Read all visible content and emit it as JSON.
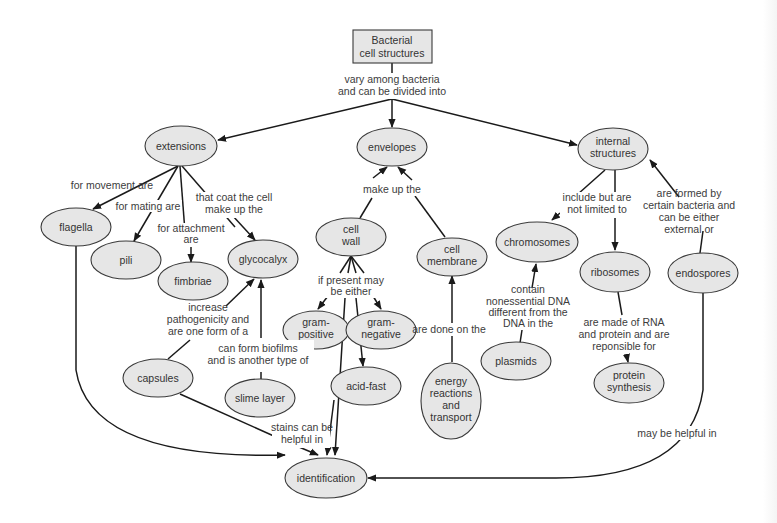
{
  "colors": {
    "node_fill": "#e6e6e6",
    "node_stroke": "#3a3a3a",
    "edge": "#1a1a1a",
    "text": "#333333",
    "background": "#ffffff"
  },
  "root": {
    "lines": [
      "Bacterial",
      "cell structures"
    ]
  },
  "nodes": {
    "extensions": {
      "lines": [
        "extensions"
      ]
    },
    "envelopes": {
      "lines": [
        "envelopes"
      ]
    },
    "internal_structures": {
      "lines": [
        "internal",
        "structures"
      ]
    },
    "flagella": {
      "lines": [
        "flagella"
      ]
    },
    "pili": {
      "lines": [
        "pili"
      ]
    },
    "fimbriae": {
      "lines": [
        "fimbriae"
      ]
    },
    "glycocalyx": {
      "lines": [
        "glycocalyx"
      ]
    },
    "cell_wall": {
      "lines": [
        "cell",
        "wall"
      ]
    },
    "cell_membrane": {
      "lines": [
        "cell",
        "membrane"
      ]
    },
    "chromosomes": {
      "lines": [
        "chromosomes"
      ]
    },
    "ribosomes": {
      "lines": [
        "ribosomes"
      ]
    },
    "endospores": {
      "lines": [
        "endospores"
      ]
    },
    "gram_positive": {
      "lines": [
        "gram-",
        "positive"
      ]
    },
    "gram_negative": {
      "lines": [
        "gram-",
        "negative"
      ]
    },
    "acid_fast": {
      "lines": [
        "acid-fast"
      ]
    },
    "capsules": {
      "lines": [
        "capsules"
      ]
    },
    "slime_layer": {
      "lines": [
        "slime layer"
      ]
    },
    "plasmids": {
      "lines": [
        "plasmids"
      ]
    },
    "energy_reactions": {
      "lines": [
        "energy",
        "reactions",
        "and",
        "transport"
      ]
    },
    "protein_synthesis": {
      "lines": [
        "protein",
        "synthesis"
      ]
    },
    "identification": {
      "lines": [
        "identification"
      ]
    }
  },
  "link_labels": {
    "vary": [
      "vary among bacteria",
      "and can be divided into"
    ],
    "movement": [
      "for movement are"
    ],
    "mating": [
      "for mating are"
    ],
    "attachment": [
      "for attachment",
      "are"
    ],
    "coat": [
      "that coat the cell",
      "make up the"
    ],
    "make_up": [
      "make up the"
    ],
    "include": [
      "include but are",
      "not limited to"
    ],
    "formed_by": [
      "are formed by",
      "certain bacteria and",
      "can be either",
      "external or"
    ],
    "if_present": [
      "if present may",
      "be either"
    ],
    "increase": [
      "increase",
      "pathogenicity and",
      "are one form of a"
    ],
    "biofilms": [
      "can form biofilms",
      "and is another type of"
    ],
    "done_on": [
      "are done on the"
    ],
    "contain": [
      "contain",
      "nonessential DNA",
      "different from the",
      "DNA in the"
    ],
    "made_of": [
      "are made of RNA",
      "and protein and are",
      "reponsible for"
    ],
    "stains": [
      "stains can be",
      "helpful in"
    ],
    "may_help": [
      "may be helpful in"
    ]
  }
}
